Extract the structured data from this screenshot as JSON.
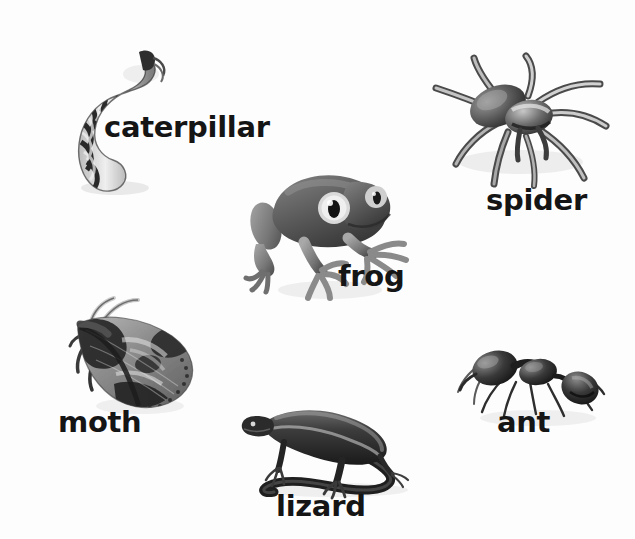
{
  "page": {
    "background_color": "#fdfdfd",
    "text_color": "#151515",
    "width": 635,
    "height": 539,
    "kind": "picture-vocabulary-worksheet"
  },
  "items": [
    {
      "id": "caterpillar",
      "label": "caterpillar",
      "icon_name": "caterpillar-photo",
      "position": "top-left"
    },
    {
      "id": "spider",
      "label": "spider",
      "icon_name": "spider-photo",
      "position": "top-right"
    },
    {
      "id": "frog",
      "label": "frog",
      "icon_name": "frog-photo",
      "position": "center"
    },
    {
      "id": "moth",
      "label": "moth",
      "icon_name": "moth-photo",
      "position": "bottom-left"
    },
    {
      "id": "lizard",
      "label": "lizard",
      "icon_name": "lizard-photo",
      "position": "bottom-center"
    },
    {
      "id": "ant",
      "label": "ant",
      "icon_name": "ant-photo",
      "position": "bottom-right"
    }
  ]
}
